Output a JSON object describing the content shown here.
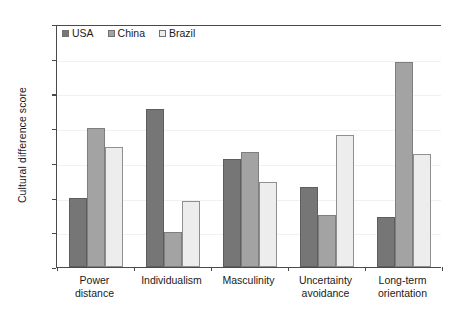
{
  "chart_data": {
    "type": "bar",
    "title": "",
    "xlabel": "",
    "ylabel": "Cultural difference score",
    "ylim": [
      0,
      140
    ],
    "yticks": [
      0,
      20,
      40,
      60,
      80,
      100,
      120,
      140
    ],
    "grid": true,
    "legend_position": "top-left",
    "categories": [
      "Power\ndistance",
      "Individualism",
      "Masculinity",
      "Uncertainty\navoidance",
      "Long-term\norientation"
    ],
    "categories_flat": [
      "Power distance",
      "Individualism",
      "Masculinity",
      "Uncertainty avoidance",
      "Long-term orientation"
    ],
    "series": [
      {
        "name": "USA",
        "color": "#767676",
        "values": [
          40,
          91,
          62,
          46,
          29
        ]
      },
      {
        "name": "China",
        "color": "#a3a3a3",
        "values": [
          80,
          20,
          66,
          30,
          118
        ]
      },
      {
        "name": "Brazil",
        "color": "#ededed",
        "values": [
          69,
          38,
          49,
          76,
          65
        ]
      }
    ]
  },
  "axis": {
    "y_title": "Cultural difference score",
    "y_tick_labels": [
      "0",
      "20",
      "40",
      "60",
      "80",
      "100",
      "120",
      "140"
    ]
  },
  "legend": {
    "items": [
      {
        "label": "USA"
      },
      {
        "label": "China"
      },
      {
        "label": "Brazil"
      }
    ]
  }
}
